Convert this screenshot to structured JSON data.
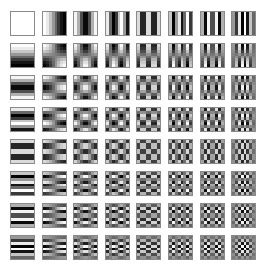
{
  "figure": {
    "rows": 8,
    "cols": 8,
    "block_size": 8,
    "layout": {
      "left": 10,
      "top": 11,
      "pitch_x": 31.6,
      "pitch_y": 32,
      "tile_size": 25
    },
    "colors": {
      "background": "#ffffff",
      "tile_border": "#8a8a8a"
    }
  }
}
